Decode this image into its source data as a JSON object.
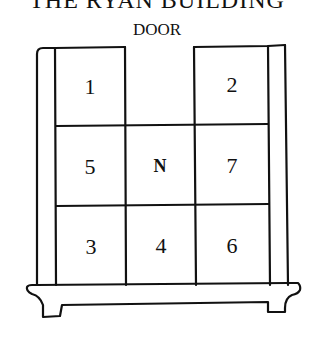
{
  "title": "THE RYAN BUILDING",
  "door_label": "DOOR",
  "rooms": [
    {
      "id": "r1",
      "label": "1",
      "row": 1,
      "col": 1
    },
    {
      "id": "r2",
      "label": "2",
      "row": 1,
      "col": 3
    },
    {
      "id": "r5",
      "label": "5",
      "row": 2,
      "col": 1
    },
    {
      "id": "rN",
      "label": "N",
      "row": 2,
      "col": 2
    },
    {
      "id": "r7",
      "label": "7",
      "row": 2,
      "col": 3
    },
    {
      "id": "r3",
      "label": "3",
      "row": 3,
      "col": 1
    },
    {
      "id": "r4",
      "label": "4",
      "row": 3,
      "col": 2
    },
    {
      "id": "r6",
      "label": "6",
      "row": 3,
      "col": 3
    }
  ],
  "layout": {
    "grid_rows": 3,
    "grid_cols": 3,
    "door_position": "top-center (row 1, col 2 open)"
  },
  "colors": {
    "line": "#111111",
    "background": "#ffffff"
  }
}
